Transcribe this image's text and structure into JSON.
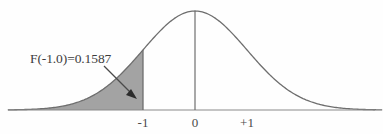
{
  "figure": {
    "name": "standard-normal-distribution-left-tail",
    "background_color": "#fefefe",
    "curve_color": "#6e6e6e",
    "axis_color": "#8a8a8a",
    "shade_color": "#a3a3a3",
    "text_color": "#3d3d3d"
  },
  "annotation": {
    "label": "F(-1.0)=0.1587",
    "arrow": {
      "from_x": 104,
      "from_y": 66,
      "to_x": 136,
      "to_y": 98
    }
  },
  "axis": {
    "ticks": [
      {
        "label": "-1",
        "x": 143
      },
      {
        "label": "0",
        "x": 195
      },
      {
        "label": "+1",
        "x": 247
      }
    ],
    "baseline_y": 110,
    "x_start": 8,
    "x_end": 375
  },
  "chart_data": {
    "type": "area",
    "title": "",
    "subtitle": "",
    "xlabel": "",
    "ylabel": "",
    "distribution": "standard normal (Gaussian), mean 0, sd 1",
    "xlim": [
      -3.6,
      3.6
    ],
    "ylim": [
      0,
      0.42
    ],
    "grid": false,
    "legend": null,
    "tick_labels": [
      "-1",
      "0",
      "+1"
    ],
    "tick_values": [
      -1,
      0,
      1
    ],
    "shaded_region": {
      "name": "left-tail",
      "from": -3.6,
      "to": -1.0,
      "area": 0.1587,
      "fill": "#a3a3a3"
    },
    "annotations": [
      {
        "text": "F(-1.0)=0.1587",
        "points_to_x": -1.15,
        "points_to_y": 0.04
      }
    ],
    "reference_lines": [
      {
        "x": -1,
        "from_y": 0,
        "to_y": 0.242
      },
      {
        "x": 0,
        "from_y": 0,
        "to_y": 0.399
      }
    ],
    "x": [
      -3.6,
      -3.4,
      -3.2,
      -3.0,
      -2.8,
      -2.6,
      -2.4,
      -2.2,
      -2.0,
      -1.8,
      -1.6,
      -1.4,
      -1.2,
      -1.0,
      -0.8,
      -0.6,
      -0.4,
      -0.2,
      0.0,
      0.2,
      0.4,
      0.6,
      0.8,
      1.0,
      1.2,
      1.4,
      1.6,
      1.8,
      2.0,
      2.2,
      2.4,
      2.6,
      2.8,
      3.0,
      3.2,
      3.4,
      3.6
    ],
    "y": [
      0.0006,
      0.0012,
      0.0024,
      0.0044,
      0.0079,
      0.0136,
      0.0224,
      0.0355,
      0.054,
      0.079,
      0.1109,
      0.1497,
      0.1942,
      0.242,
      0.2897,
      0.3332,
      0.3683,
      0.391,
      0.3989,
      0.391,
      0.3683,
      0.3332,
      0.2897,
      0.242,
      0.1942,
      0.1497,
      0.1109,
      0.079,
      0.054,
      0.0355,
      0.0224,
      0.0136,
      0.0079,
      0.0044,
      0.0024,
      0.0012,
      0.0006
    ]
  }
}
